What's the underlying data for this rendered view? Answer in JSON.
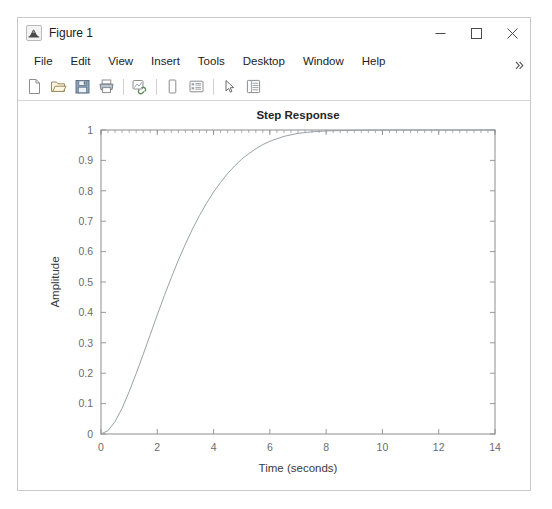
{
  "window": {
    "title": "Figure 1",
    "icon": "matlab-membrane-icon",
    "controls": {
      "minimize": "minimize-icon",
      "maximize": "maximize-icon",
      "close": "close-icon"
    }
  },
  "menubar": {
    "items": [
      {
        "label": "File"
      },
      {
        "label": "Edit"
      },
      {
        "label": "View"
      },
      {
        "label": "Insert"
      },
      {
        "label": "Tools"
      },
      {
        "label": "Desktop"
      },
      {
        "label": "Window"
      },
      {
        "label": "Help"
      }
    ],
    "overflow": "chevron-expand-icon"
  },
  "toolbar": {
    "buttons": [
      {
        "name": "new-figure-icon"
      },
      {
        "name": "open-file-icon"
      },
      {
        "name": "save-figure-icon"
      },
      {
        "name": "print-figure-icon"
      },
      {
        "name": "link-plot-icon"
      },
      {
        "name": "insert-colorbar-icon"
      },
      {
        "name": "insert-legend-icon"
      },
      {
        "name": "pointer-arrow-icon"
      },
      {
        "name": "property-inspector-icon"
      }
    ]
  },
  "chart_data": {
    "type": "line",
    "title": "Step Response",
    "xlabel": "Time (seconds)",
    "ylabel": "Amplitude",
    "xlim": [
      0,
      14
    ],
    "ylim": [
      0,
      1
    ],
    "xticks": [
      0,
      2,
      4,
      6,
      8,
      10,
      12,
      14
    ],
    "yticks": [
      0,
      0.1,
      0.2,
      0.3,
      0.4,
      0.5,
      0.6,
      0.7,
      0.8,
      0.9,
      1
    ],
    "xtick_labels": [
      "0",
      "2",
      "4",
      "6",
      "8",
      "10",
      "12",
      "14"
    ],
    "ytick_labels": [
      "0",
      "0.1",
      "0.2",
      "0.3",
      "0.4",
      "0.5",
      "0.6",
      "0.7",
      "0.8",
      "0.9",
      "1"
    ],
    "grid": false,
    "legend": null,
    "line_color": "#9aa0a6",
    "box_color": "#8d8d8d",
    "series": [
      {
        "name": "step-response",
        "x": [
          0,
          0.25,
          0.5,
          0.75,
          1,
          1.25,
          1.5,
          1.75,
          2,
          2.25,
          2.5,
          2.75,
          3,
          3.25,
          3.5,
          3.75,
          4,
          4.25,
          4.5,
          4.75,
          5,
          5.25,
          5.5,
          5.75,
          6,
          6.5,
          7,
          7.5,
          8,
          8.5,
          9,
          9.5,
          10,
          10.5,
          11,
          11.5,
          12,
          12.5,
          13,
          13.5,
          14
        ],
        "y": [
          0,
          0.011,
          0.041,
          0.085,
          0.139,
          0.199,
          0.262,
          0.327,
          0.392,
          0.455,
          0.515,
          0.572,
          0.625,
          0.674,
          0.719,
          0.759,
          0.796,
          0.828,
          0.857,
          0.882,
          0.904,
          0.922,
          0.938,
          0.952,
          0.963,
          0.979,
          0.989,
          0.994,
          0.997,
          0.998,
          0.999,
          0.9995,
          0.9998,
          0.9999,
          1,
          1,
          1,
          1,
          1,
          1,
          1
        ]
      }
    ]
  }
}
